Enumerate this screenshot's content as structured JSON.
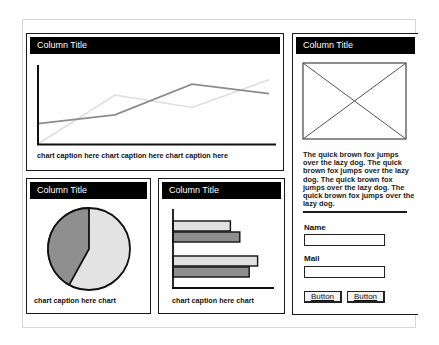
{
  "panels": {
    "line_panel": {
      "title": "Column Title",
      "caption": "chart caption here chart caption here chart caption here"
    },
    "pie_panel": {
      "title": "Column Title",
      "caption": "chart caption here chart"
    },
    "bar_panel": {
      "title": "Column Title",
      "caption": "chart caption here chart"
    },
    "side_panel": {
      "title": "Column Title",
      "image_placeholder": "image-placeholder",
      "paragraph": "The quick brown fox jumps over the lazy dog. The quick brown fox jumps over the lazy dog. The quick brown fox jumps over the lazy dog. The quick brown fox jumps over the lazy dog.",
      "form": {
        "name_label": "Name",
        "name_value": "",
        "mail_label": "Mail",
        "mail_value": "",
        "button1_label": "Button",
        "button2_label": "Button"
      }
    }
  },
  "colors": {
    "header_bg": "#000000",
    "series_dark": "#8c8c8c",
    "series_light": "#dedede",
    "pie_dark": "#8f8f8f",
    "pie_light": "#e3e3e3"
  },
  "chart_data": [
    {
      "type": "line",
      "title": "Column Title",
      "caption": "chart caption here chart caption here chart caption here",
      "x": [
        1,
        2,
        3,
        4
      ],
      "series": [
        {
          "name": "dark",
          "values": [
            28,
            40,
            82,
            69
          ]
        },
        {
          "name": "light",
          "values": [
            0,
            67,
            50,
            88
          ]
        }
      ],
      "xlabel": "",
      "ylabel": "",
      "ylim": [
        0,
        100
      ],
      "grid": false
    },
    {
      "type": "pie",
      "title": "Column Title",
      "caption": "chart caption here chart",
      "categories": [
        "dark",
        "light"
      ],
      "values": [
        42,
        58
      ]
    },
    {
      "type": "bar",
      "orientation": "horizontal",
      "title": "Column Title",
      "caption": "chart caption here chart",
      "categories": [
        "group1",
        "group2"
      ],
      "series": [
        {
          "name": "light",
          "values": [
            55,
            81
          ]
        },
        {
          "name": "dark",
          "values": [
            64,
            73
          ]
        }
      ],
      "xlim": [
        0,
        100
      ]
    }
  ]
}
